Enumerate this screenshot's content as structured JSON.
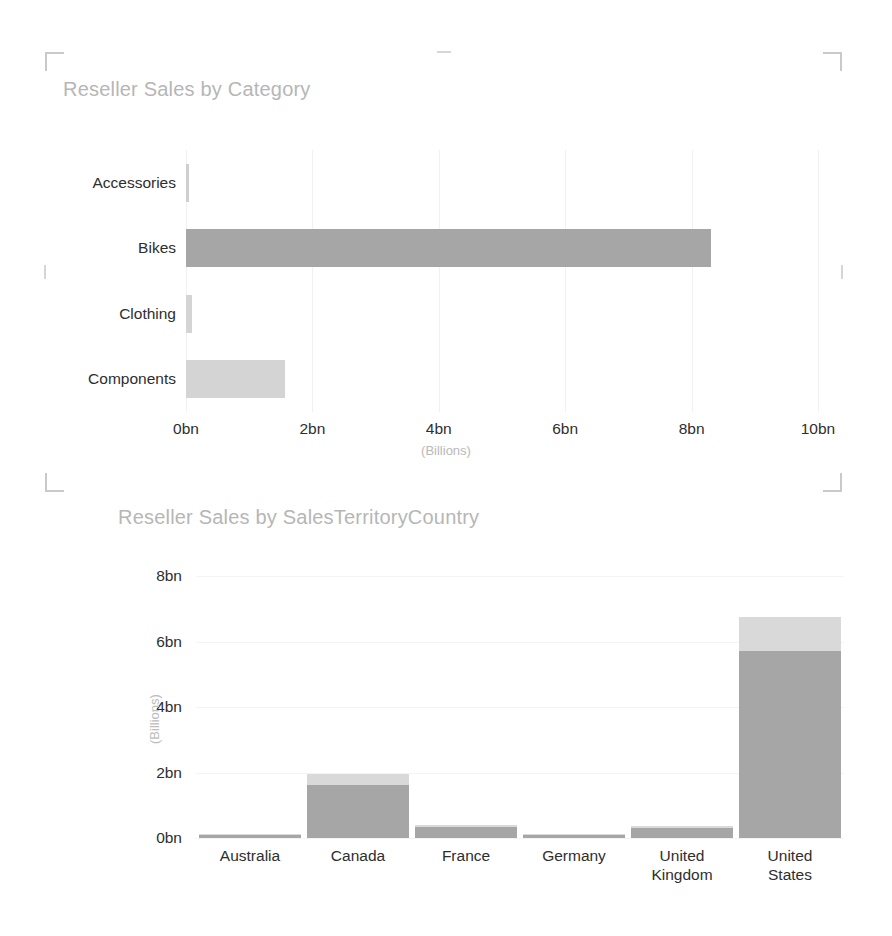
{
  "chart_data": [
    {
      "type": "bar",
      "orientation": "horizontal",
      "title": "Reseller Sales by Category",
      "categories": [
        "Accessories",
        "Bikes",
        "Clothing",
        "Components"
      ],
      "values": [
        0.02,
        8.3,
        0.09,
        1.56
      ],
      "xlabel": "(Billions)",
      "ylabel": "",
      "xlim": [
        0,
        10
      ],
      "xticks": [
        "0bn",
        "2bn",
        "4bn",
        "6bn",
        "8bn",
        "10bn"
      ],
      "xtick_values": [
        0,
        2,
        4,
        6,
        8,
        10
      ],
      "grid": true,
      "legend": "none",
      "bar_colors": [
        "#cfcfcf",
        "#a6a6a6",
        "#d4d4d4",
        "#d4d4d4"
      ]
    },
    {
      "type": "bar",
      "orientation": "vertical",
      "stacked": true,
      "title": "Reseller Sales by SalesTerritoryCountry",
      "categories": [
        "Australia",
        "Canada",
        "France",
        "Germany",
        "United Kingdom",
        "United States"
      ],
      "series": [
        {
          "name": "lower",
          "values": [
            0.09,
            1.62,
            0.33,
            0.1,
            0.32,
            5.72
          ]
        },
        {
          "name": "upper",
          "values": [
            0.02,
            0.32,
            0.08,
            0.02,
            0.06,
            1.02
          ]
        }
      ],
      "xlabel": "",
      "ylabel": "(Billions)",
      "ylim": [
        0,
        8
      ],
      "yticks": [
        "0bn",
        "2bn",
        "4bn",
        "6bn",
        "8bn"
      ],
      "ytick_values": [
        0,
        2,
        4,
        6,
        8
      ],
      "grid": true,
      "legend": "none",
      "segment_colors": {
        "lower": "#a6a6a6",
        "upper": "#d9d9d9"
      }
    }
  ],
  "colors": {
    "title": "#b6b6b6",
    "tick": "#2e2e2e",
    "axis_label": "#bcbcbc",
    "grid": "#f1f1f1",
    "bar_dark": "#a6a6a6",
    "bar_light": "#d9d9d9",
    "selection_frame": "#c9c9c9",
    "background": "#ffffff"
  },
  "selection": {
    "name": "chart-selection-frame"
  },
  "icons": {
    "corner_top_left": "corner-bracket-icon",
    "corner_top_right": "corner-bracket-icon",
    "corner_bottom_left": "corner-bracket-icon",
    "corner_bottom_right": "corner-bracket-icon"
  }
}
